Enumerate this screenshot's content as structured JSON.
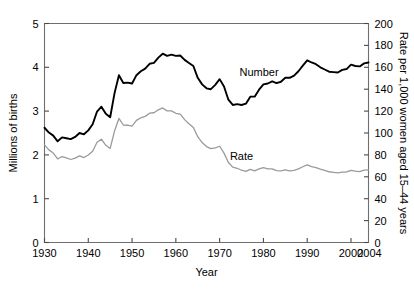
{
  "chart_data": {
    "type": "line",
    "title": "",
    "xlabel": "Year",
    "ylabel": "Millions of births",
    "y2label": "Rate per 1,000 women aged 15–44 years",
    "xlim": [
      1930,
      2004
    ],
    "ylim": [
      0,
      5
    ],
    "y2lim": [
      0,
      200
    ],
    "grid": false,
    "legend_position": "inline-annotation",
    "x_ticks": [
      1930,
      1940,
      1950,
      1960,
      1970,
      1980,
      1990,
      2000
    ],
    "x_tick_labels": [
      "1930",
      "1940",
      "1950",
      "1960",
      "1970",
      "1980",
      "1990",
      "2000"
    ],
    "x_end_label": "2004",
    "y_ticks": [
      0,
      1,
      2,
      3,
      4,
      5
    ],
    "y_tick_labels": [
      "0",
      "1",
      "2",
      "3",
      "4",
      "5"
    ],
    "y2_ticks": [
      0,
      20,
      40,
      60,
      80,
      100,
      120,
      140,
      160,
      180,
      200
    ],
    "y2_tick_labels": [
      "0",
      "20",
      "40",
      "60",
      "80",
      "100",
      "120",
      "140",
      "160",
      "180",
      "200"
    ],
    "x": [
      1930,
      1931,
      1932,
      1933,
      1934,
      1935,
      1936,
      1937,
      1938,
      1939,
      1940,
      1941,
      1942,
      1943,
      1944,
      1945,
      1946,
      1947,
      1948,
      1949,
      1950,
      1951,
      1952,
      1953,
      1954,
      1955,
      1956,
      1957,
      1958,
      1959,
      1960,
      1961,
      1962,
      1963,
      1964,
      1965,
      1966,
      1967,
      1968,
      1969,
      1970,
      1971,
      1972,
      1973,
      1974,
      1975,
      1976,
      1977,
      1978,
      1979,
      1980,
      1981,
      1982,
      1983,
      1984,
      1985,
      1986,
      1987,
      1988,
      1989,
      1990,
      1991,
      1992,
      1993,
      1994,
      1995,
      1996,
      1997,
      1998,
      1999,
      2000,
      2001,
      2002,
      2003,
      2004
    ],
    "series": [
      {
        "name": "Number",
        "units": "millions of births",
        "axis": "left",
        "color": "#000000",
        "label_text": "Number",
        "values": [
          2.62,
          2.51,
          2.44,
          2.31,
          2.4,
          2.38,
          2.36,
          2.41,
          2.5,
          2.47,
          2.56,
          2.7,
          2.99,
          3.1,
          2.94,
          2.86,
          3.41,
          3.82,
          3.64,
          3.65,
          3.63,
          3.82,
          3.91,
          3.97,
          4.08,
          4.1,
          4.22,
          4.31,
          4.26,
          4.29,
          4.26,
          4.27,
          4.17,
          4.1,
          4.03,
          3.76,
          3.61,
          3.52,
          3.5,
          3.6,
          3.73,
          3.56,
          3.26,
          3.14,
          3.16,
          3.14,
          3.17,
          3.33,
          3.33,
          3.49,
          3.61,
          3.63,
          3.68,
          3.64,
          3.67,
          3.76,
          3.76,
          3.81,
          3.91,
          4.04,
          4.16,
          4.11,
          4.07,
          4.0,
          3.95,
          3.9,
          3.89,
          3.88,
          3.94,
          3.96,
          4.06,
          4.03,
          4.02,
          4.09,
          4.11
        ]
      },
      {
        "name": "Rate",
        "units": "rate per 1,000 women aged 15-44 years",
        "axis": "right",
        "color": "#9a9a9a",
        "label_text": "Rate",
        "values": [
          89.2,
          84.6,
          81.7,
          76.3,
          78.5,
          77.2,
          75.8,
          77.1,
          79.1,
          77.6,
          79.9,
          83.4,
          91.5,
          94.3,
          88.8,
          85.9,
          101.9,
          113.3,
          107.3,
          107.1,
          106.2,
          111.5,
          113.9,
          115.2,
          118.1,
          118.5,
          121.2,
          122.9,
          120.2,
          120.2,
          118.0,
          117.2,
          112.2,
          108.5,
          105.0,
          96.6,
          91.3,
          87.6,
          85.7,
          86.5,
          87.9,
          81.6,
          73.1,
          68.8,
          67.8,
          66.0,
          65.0,
          66.8,
          65.5,
          67.2,
          68.4,
          67.3,
          67.3,
          65.7,
          65.4,
          66.3,
          65.4,
          65.8,
          67.3,
          69.2,
          70.9,
          69.3,
          68.4,
          67.0,
          65.9,
          64.6,
          64.1,
          63.6,
          64.3,
          64.4,
          65.9,
          65.1,
          64.8,
          66.1,
          66.3
        ]
      }
    ],
    "annotations": [
      {
        "text": "Number",
        "x": 1979,
        "y_axis_value": 3.8,
        "name": "number-series-label"
      },
      {
        "text": "Rate",
        "x": 1975,
        "y_axis_value": 1.88,
        "name": "rate-series-label"
      }
    ]
  }
}
